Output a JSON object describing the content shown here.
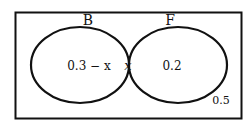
{
  "diagram": {
    "type": "venn",
    "universe_label": "",
    "sets": [
      {
        "name": "B",
        "label": "B"
      },
      {
        "name": "F",
        "label": "F"
      }
    ],
    "regions": {
      "B_only": "0.3 − x",
      "intersection": "x",
      "F_only": "0.2",
      "outside": "0.5"
    },
    "colors": {
      "stroke": "#111111",
      "background": "#ffffff"
    }
  }
}
